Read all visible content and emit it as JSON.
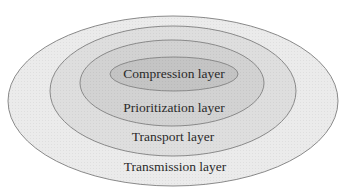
{
  "diagram": {
    "type": "nested-ellipses",
    "layers": [
      {
        "label": "Transmission layer",
        "fill": "#ebebeb",
        "level": 1
      },
      {
        "label": "Transport layer",
        "fill": "#dedede",
        "level": 2
      },
      {
        "label": "Prioritization layer",
        "fill": "#d2d2d2",
        "level": 3
      },
      {
        "label": "Compression layer",
        "fill": "#c4c4c4",
        "level": 4
      }
    ],
    "colors": {
      "background": "#ffffff",
      "stroke": "#8a8a8a",
      "text": "#2a2a2a"
    }
  }
}
